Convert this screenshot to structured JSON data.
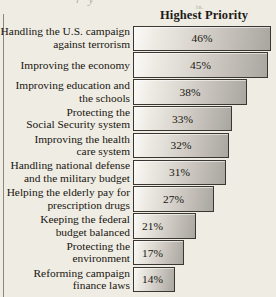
{
  "artifact": {
    "ghost_line": "r   y",
    "ghost_line2": "in."
  },
  "header": {
    "title": "Highest Priority"
  },
  "chart_data": {
    "type": "bar",
    "orientation": "horizontal",
    "title": "Highest Priority",
    "xlabel": "",
    "ylabel": "",
    "grid": false,
    "legend": "none",
    "xlim": [
      0,
      48
    ],
    "value_suffix": "%",
    "categories": [
      "Handling the U.S. campaign\nagainst terrorism",
      "Improving the economy",
      "Improving education and\nthe schools",
      "Protecting the\nSocial Security system",
      "Improving the health\ncare system",
      "Handling national defense\nand the military budget",
      "Helping the elderly pay for\nprescription drugs",
      "Keeping the federal\nbudget balanced",
      "Protecting the\nenvironment",
      "Reforming campaign\nfinance laws"
    ],
    "values": [
      46,
      45,
      38,
      33,
      32,
      31,
      27,
      21,
      17,
      14
    ],
    "labels": [
      "46%",
      "45%",
      "38%",
      "33%",
      "32%",
      "31%",
      "27%",
      "21%",
      "17%",
      "14%"
    ]
  },
  "rows": [
    {
      "label": "Handling the U.S. campaign\nagainst terrorism",
      "value": "46%",
      "pct": 46
    },
    {
      "label": "Improving the economy",
      "value": "45%",
      "pct": 45
    },
    {
      "label": "Improving education and\nthe schools",
      "value": "38%",
      "pct": 38
    },
    {
      "label": "Protecting the\nSocial Security system",
      "value": "33%",
      "pct": 33
    },
    {
      "label": "Improving the health\ncare system",
      "value": "32%",
      "pct": 32
    },
    {
      "label": "Handling national defense\nand the military budget",
      "value": "31%",
      "pct": 31
    },
    {
      "label": "Helping the elderly pay for\nprescription drugs",
      "value": "27%",
      "pct": 27
    },
    {
      "label": "Keeping the federal\nbudget balanced",
      "value": "21%",
      "pct": 21
    },
    {
      "label": "Protecting the\nenvironment",
      "value": "17%",
      "pct": 17
    },
    {
      "label": "Reforming campaign\nfinance laws",
      "value": "14%",
      "pct": 14
    }
  ],
  "colors": {
    "page_background": "#efece4",
    "bar_light": "#fbfaf7",
    "bar_dark": "#a9a5a0",
    "bar_border": "#3a3733",
    "text": "#17150f"
  }
}
